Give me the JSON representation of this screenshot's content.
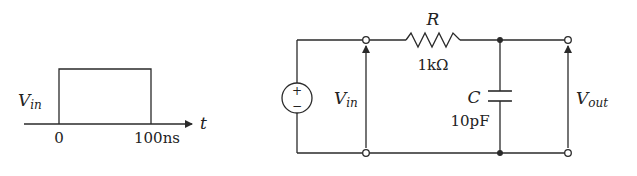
{
  "colors": {
    "ink": "#2a2a2a",
    "background": "#ffffff"
  },
  "waveform": {
    "signal_label": "V",
    "signal_sub": "in",
    "axis_label": "t",
    "ticks": [
      {
        "label": "0"
      },
      {
        "label": "100ns"
      }
    ]
  },
  "circuit": {
    "source": {
      "plus": "+",
      "minus": "−"
    },
    "input_label": {
      "main": "V",
      "sub": "in"
    },
    "output_label": {
      "main": "V",
      "sub": "out"
    },
    "resistor": {
      "name": "R",
      "value": "1kΩ"
    },
    "capacitor": {
      "name": "C",
      "value": "10pF"
    }
  }
}
